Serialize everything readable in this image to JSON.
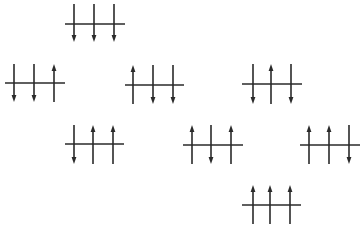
{
  "diagram": {
    "colors": {
      "line": "#2a2a2a",
      "background": "#ffffff"
    },
    "stroke_width": 1.6,
    "configurations": [
      {
        "id": "ddd",
        "spins": [
          "down",
          "down",
          "down"
        ],
        "baseline": {
          "x1": 65,
          "x2": 125,
          "y": 24
        },
        "xs": [
          74,
          94,
          114
        ],
        "y_top": 4,
        "y_bottom": 42
      },
      {
        "id": "ddu",
        "spins": [
          "down",
          "down",
          "up"
        ],
        "baseline": {
          "x1": 5,
          "x2": 65,
          "y": 83
        },
        "xs": [
          14,
          34,
          54
        ],
        "y_top": 64,
        "y_bottom": 102
      },
      {
        "id": "udd",
        "spins": [
          "up",
          "down",
          "down"
        ],
        "baseline": {
          "x1": 125,
          "x2": 184,
          "y": 85
        },
        "xs": [
          133,
          153,
          173
        ],
        "y_top": 65,
        "y_bottom": 104
      },
      {
        "id": "dud",
        "spins": [
          "down",
          "up",
          "down"
        ],
        "baseline": {
          "x1": 242,
          "x2": 302,
          "y": 84
        },
        "xs": [
          253,
          271,
          291
        ],
        "y_top": 64,
        "y_bottom": 104
      },
      {
        "id": "duu",
        "spins": [
          "down",
          "up",
          "up"
        ],
        "baseline": {
          "x1": 65,
          "x2": 124,
          "y": 144
        },
        "xs": [
          74,
          93,
          113
        ],
        "y_top": 125,
        "y_bottom": 164
      },
      {
        "id": "udu",
        "spins": [
          "up",
          "down",
          "up"
        ],
        "baseline": {
          "x1": 183,
          "x2": 243,
          "y": 145
        },
        "xs": [
          192,
          211,
          231
        ],
        "y_top": 125,
        "y_bottom": 164
      },
      {
        "id": "uud",
        "spins": [
          "up",
          "up",
          "down"
        ],
        "baseline": {
          "x1": 300,
          "x2": 360,
          "y": 145
        },
        "xs": [
          309,
          329,
          349
        ],
        "y_top": 125,
        "y_bottom": 164
      },
      {
        "id": "uuu",
        "spins": [
          "up",
          "up",
          "up"
        ],
        "baseline": {
          "x1": 242,
          "x2": 301,
          "y": 205
        },
        "xs": [
          253,
          270,
          290
        ],
        "y_top": 185,
        "y_bottom": 224
      }
    ]
  }
}
